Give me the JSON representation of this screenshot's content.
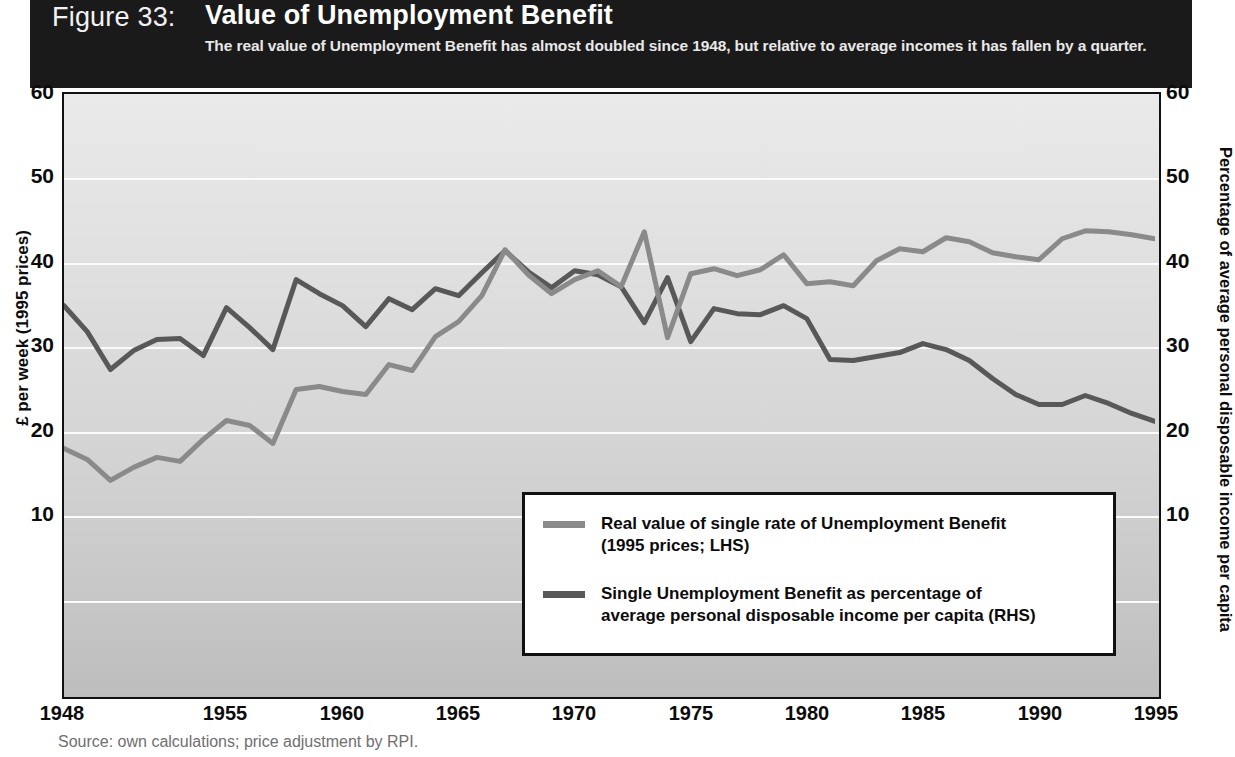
{
  "figure": {
    "number_label": "Figure 33:",
    "title": "Value of Unemployment Benefit",
    "subtitle": "The real value of Unemployment Benefit has almost doubled since 1948, but relative to average incomes it has fallen by a quarter.",
    "source": "Source: own calculations; price adjustment by RPI."
  },
  "colors": {
    "title_band": "#1a1a1a",
    "series_lhs": "#8a8a8a",
    "series_rhs": "#585858",
    "gridline": "#fbfbfb",
    "frame": "#111111",
    "plot_bg_top": "#eaeaea",
    "plot_bg_bottom": "#bdbdbd"
  },
  "legend": {
    "entries": [
      {
        "line1": "Real value of single rate of Unemployment Benefit",
        "line2": "(1995 prices; LHS)",
        "color": "#8a8a8a"
      },
      {
        "line1": "Single Unemployment Benefit as percentage of",
        "line2": "average personal disposable income per capita (RHS)",
        "color": "#585858"
      }
    ]
  },
  "chart_data": {
    "type": "line",
    "title": "Value of Unemployment Benefit",
    "subtitle": "The real value of Unemployment Benefit has almost doubled since 1948, but relative to average incomes it has fallen by a quarter.",
    "xlabel": "",
    "ylabel": "£ per week (1995 prices)",
    "y2label": "Percentage of average personal disposable income per capita",
    "xlim": [
      1948,
      1995
    ],
    "ylim": [
      0,
      60
    ],
    "y2lim": [
      0,
      60
    ],
    "yticks": [
      10,
      20,
      30,
      40,
      50,
      60
    ],
    "y2ticks": [
      10,
      20,
      30,
      40,
      50,
      60
    ],
    "xticks": [
      1948,
      1955,
      1960,
      1965,
      1970,
      1975,
      1980,
      1985,
      1990,
      1995
    ],
    "xtick_labels": [
      "1948",
      "1955",
      "1960",
      "1965",
      "1970",
      "1975",
      "1980",
      "1985",
      "1990",
      "1995"
    ],
    "grid": true,
    "legend_position": "lower-center-right",
    "x": [
      1948,
      1949,
      1950,
      1951,
      1952,
      1953,
      1954,
      1955,
      1956,
      1957,
      1958,
      1959,
      1960,
      1961,
      1962,
      1963,
      1964,
      1965,
      1966,
      1967,
      1968,
      1969,
      1970,
      1971,
      1972,
      1973,
      1974,
      1975,
      1976,
      1977,
      1978,
      1979,
      1980,
      1981,
      1982,
      1983,
      1984,
      1985,
      1986,
      1987,
      1988,
      1989,
      1990,
      1991,
      1992,
      1993,
      1994,
      1995
    ],
    "series": [
      {
        "name": "Real value of single rate of Unemployment Benefit (1995 prices; LHS)",
        "axis": "left",
        "units": "£ per week (1995 prices)",
        "color": "#8a8a8a",
        "values": [
          24.5,
          23.4,
          21.3,
          22.6,
          23.6,
          23.2,
          25.4,
          27.3,
          26.8,
          25.0,
          30.4,
          30.7,
          30.2,
          29.9,
          32.9,
          32.3,
          35.7,
          37.2,
          39.8,
          44.4,
          41.9,
          40.0,
          41.4,
          42.3,
          40.7,
          46.2,
          35.6,
          42.0,
          42.5,
          41.8,
          42.4,
          43.9,
          41.0,
          41.2,
          40.8,
          43.3,
          44.5,
          44.2,
          45.6,
          45.2,
          44.1,
          43.7,
          43.4,
          45.5,
          46.3,
          46.2,
          45.9,
          45.5
        ]
      },
      {
        "name": "Single Unemployment Benefit as percentage of average personal disposable income per capita (RHS)",
        "axis": "right",
        "units": "percent",
        "color": "#585858",
        "values": [
          38.8,
          36.2,
          32.4,
          34.3,
          35.4,
          35.5,
          33.8,
          38.6,
          36.6,
          34.4,
          41.4,
          40.0,
          38.8,
          36.7,
          39.5,
          38.4,
          40.5,
          39.8,
          42.1,
          44.3,
          42.2,
          40.6,
          42.3,
          41.9,
          40.7,
          37.1,
          41.6,
          35.2,
          38.5,
          38.0,
          37.9,
          38.8,
          37.5,
          33.4,
          33.3,
          33.7,
          34.1,
          35.0,
          34.4,
          33.3,
          31.5,
          29.9,
          28.9,
          28.9,
          29.8,
          29.0,
          28.0,
          27.2
        ]
      }
    ]
  }
}
